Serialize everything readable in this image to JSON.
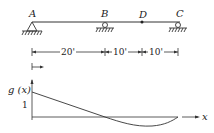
{
  "beam": {
    "points": [
      {
        "label": "A",
        "support": "pin"
      },
      {
        "label": "B",
        "support": "roller"
      },
      {
        "label": "D",
        "support": "none"
      },
      {
        "label": "C",
        "support": "roller"
      }
    ]
  },
  "dimensions": [
    {
      "label": "20'"
    },
    {
      "label": "10'"
    },
    {
      "label": "10'"
    }
  ],
  "graph": {
    "y_label": "g (x)",
    "y_tick": "1",
    "x_label": "x"
  },
  "colors": {
    "stroke": "#333333",
    "background": "#ffffff"
  }
}
